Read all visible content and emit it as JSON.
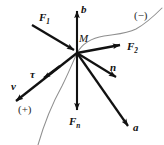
{
  "figure": {
    "origin_label": "M",
    "colors": {
      "vector": "#111111",
      "curve": "#8a8a8a",
      "background": "#ffffff"
    },
    "origin": {
      "x": 77,
      "y": 53
    },
    "vectors": [
      {
        "name": "binormal",
        "label": "b",
        "subscript": "",
        "tip": {
          "x": 77,
          "y": 9
        },
        "direction": "up"
      },
      {
        "name": "force-1",
        "label": "F",
        "subscript": "1",
        "tip": {
          "x": 77,
          "y": 53
        },
        "direction": "down-right-into-origin"
      },
      {
        "name": "force-2",
        "label": "F",
        "subscript": "2",
        "tip": {
          "x": 123,
          "y": 45
        },
        "direction": "right-slightly-up"
      },
      {
        "name": "normal",
        "label": "n",
        "subscript": "",
        "tip": {
          "x": 119,
          "y": 79
        },
        "direction": "down-right"
      },
      {
        "name": "acceleration",
        "label": "a",
        "subscript": "",
        "tip": {
          "x": 131,
          "y": 129
        },
        "direction": "down-right-steep"
      },
      {
        "name": "normal-force",
        "label": "F",
        "subscript": "n",
        "tip": {
          "x": 77,
          "y": 113
        },
        "direction": "down"
      },
      {
        "name": "tangent",
        "label": "τ",
        "subscript": "",
        "tip": {
          "x": 41,
          "y": 80
        },
        "direction": "down-left-short"
      },
      {
        "name": "velocity",
        "label": "v",
        "subscript": "",
        "tip": {
          "x": 13,
          "y": 104
        },
        "direction": "down-left"
      }
    ],
    "sign_markers": [
      {
        "name": "positive-direction",
        "label": "(+)",
        "x": 18,
        "y": 104
      },
      {
        "name": "negative-direction",
        "label": "(−)",
        "x": 134,
        "y": 10
      }
    ],
    "trajectory": {
      "name": "path-curve",
      "description": "thin curve passing through M from lower-left (+) to upper-right (−)"
    }
  }
}
